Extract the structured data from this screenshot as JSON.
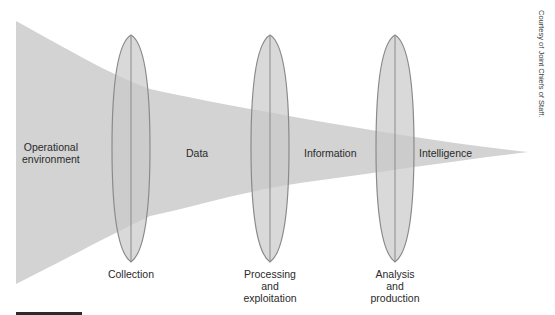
{
  "diagram": {
    "colors": {
      "funnel": "#d3d3d3",
      "lens_fill": "#c9c9c9",
      "lens_stroke": "#8a8a8a",
      "text": "#2a2a2a",
      "rule": "#2b2b2b"
    },
    "region_labels": [
      {
        "id": "operational-environment",
        "text": "Operational\nenvironment"
      },
      {
        "id": "data",
        "text": "Data"
      },
      {
        "id": "information",
        "text": "Information"
      },
      {
        "id": "intelligence",
        "text": "Intelligence"
      }
    ],
    "stages": [
      {
        "id": "collection",
        "label": "Collection"
      },
      {
        "id": "processing-exploitation",
        "label": "Processing\nand\nexploitation"
      },
      {
        "id": "analysis-production",
        "label": "Analysis\nand\nproduction"
      }
    ],
    "credit": "Courtesy of Joint Chiefs of Staff."
  }
}
